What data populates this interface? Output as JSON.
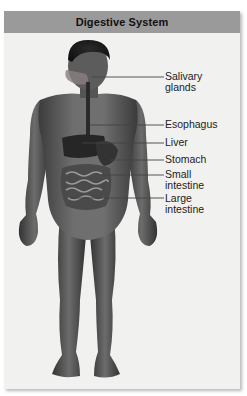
{
  "title": "Digestive System",
  "colors": {
    "header_bg": "#9a9a9a",
    "panel_bg": "#f1f1f0",
    "figure_skin": "#5a5a5a",
    "leader_line": "#444444",
    "label_text": "#222222"
  },
  "labels": [
    {
      "id": "salivary-glands",
      "lines": [
        "Salivary",
        "glands"
      ],
      "line_y": 77,
      "line_x1": 92,
      "line_x2": 164
    },
    {
      "id": "esophagus",
      "lines": [
        "Esophagus"
      ],
      "line_y": 125,
      "line_x1": 90,
      "line_x2": 164
    },
    {
      "id": "liver",
      "lines": [
        "Liver"
      ],
      "line_y": 143,
      "line_x1": 82,
      "line_x2": 164
    },
    {
      "id": "stomach",
      "lines": [
        "Stomach"
      ],
      "line_y": 160,
      "line_x1": 110,
      "line_x2": 164
    },
    {
      "id": "small-intestine",
      "lines": [
        "Small",
        "intestine"
      ],
      "line_y": 175,
      "line_x1": 100,
      "line_x2": 164
    },
    {
      "id": "large-intestine",
      "lines": [
        "Large",
        "intestine"
      ],
      "line_y": 198,
      "line_x1": 70,
      "line_x2": 164
    }
  ]
}
